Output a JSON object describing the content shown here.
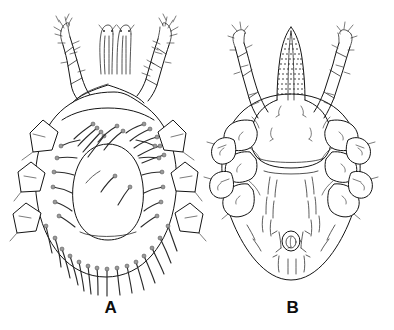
{
  "figure": {
    "kind": "scientific-line-drawing",
    "background_color": "#ffffff",
    "ink_color": "#141414",
    "width": 394,
    "height": 330,
    "panels": [
      {
        "id": "A",
        "label": "A",
        "view": "dorsal",
        "description": "Dorsal view of mite idiosoma with central dorsal shield, three pairs of lateral coxal plates, paired elongate anterior chelicerae, two anterior legs, and numerous curved setae around the body margin and on the dorsum.",
        "center_x": 110,
        "body": {
          "outline_cx": 106,
          "outline_cy": 186,
          "outline_rx": 72,
          "outline_ry": 92,
          "shield_cx": 108,
          "shield_cy": 193,
          "shield_rx": 36,
          "shield_ry": 48
        },
        "features": [
          {
            "name": "chelicerae",
            "count": 2
          },
          {
            "name": "anterior-legs",
            "count": 2
          },
          {
            "name": "coxal-plates-left",
            "count": 3
          },
          {
            "name": "coxal-plates-right",
            "count": 3
          },
          {
            "name": "dorsal-setae",
            "count": 22
          },
          {
            "name": "marginal-setae",
            "count": 14
          }
        ]
      },
      {
        "id": "B",
        "label": "B",
        "view": "ventral",
        "description": "Ventral view of mite idiosoma showing stippled denticulate gnathosoma, anterior sternal shield, four pairs of coxal plates bearing setae, paired anterior legs, a small circular anal opening with flanking setae, and fine ventral setae.",
        "center_x": 292,
        "body": {
          "outline_cx": 291,
          "outline_cy": 188,
          "outline_rx": 70,
          "outline_ry": 92,
          "gnathosoma_x": 291,
          "gnathosoma_top_y": 28,
          "gnathosoma_bottom_y": 100,
          "anal_cx": 291,
          "anal_cy": 241,
          "anal_r": 9
        },
        "features": [
          {
            "name": "gnathosoma-denticulate",
            "count": 1
          },
          {
            "name": "sternal-shield",
            "count": 1
          },
          {
            "name": "anterior-legs",
            "count": 2
          },
          {
            "name": "coxal-plates-left",
            "count": 4
          },
          {
            "name": "coxal-plates-right",
            "count": 4
          },
          {
            "name": "anal-opening",
            "count": 1
          },
          {
            "name": "ventral-setae",
            "count": 16
          }
        ]
      }
    ]
  }
}
